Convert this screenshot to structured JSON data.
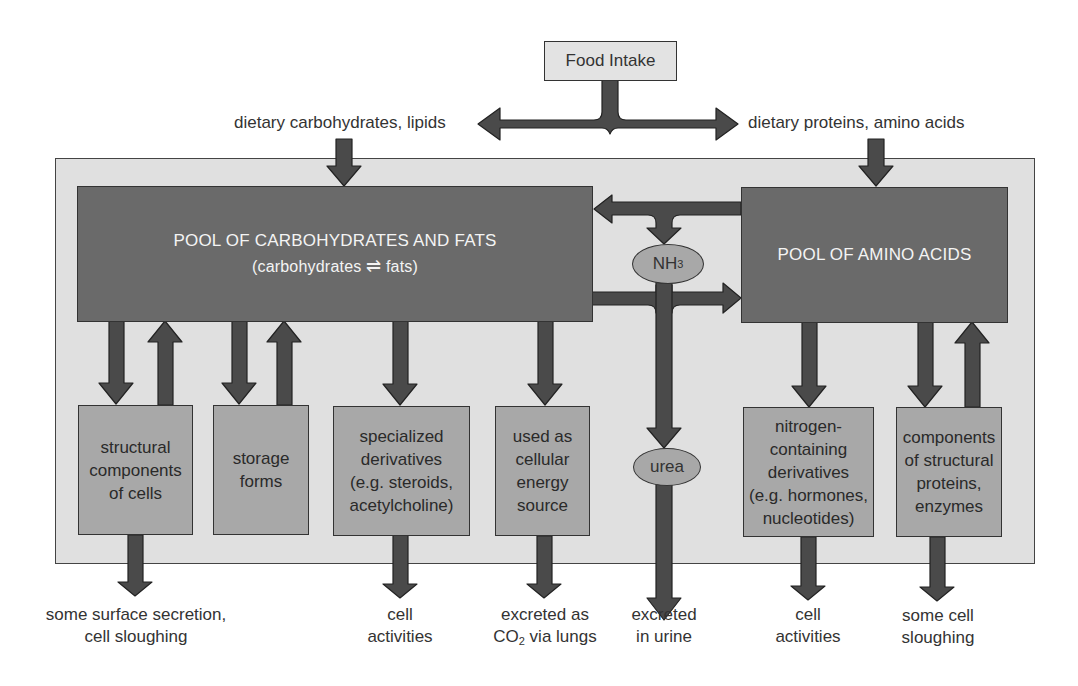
{
  "top": {
    "food_intake": "Food Intake",
    "left_input": "dietary carbohydrates, lipids",
    "right_input": "dietary proteins, amino acids"
  },
  "pools": {
    "carb_fat": {
      "title": "POOL OF CARBOHYDRATES AND FATS",
      "subtitle_left": "(carbohydrates",
      "subtitle_right": "fats)",
      "equilibrium_symbol": "⇌"
    },
    "amino": {
      "title": "POOL OF AMINO ACIDS"
    }
  },
  "intermediates": {
    "nh3": {
      "base": "NH",
      "subscript": "3"
    },
    "urea": "urea"
  },
  "boxes": [
    {
      "id": "structural",
      "lines": [
        "structural",
        "components",
        "of cells"
      ]
    },
    {
      "id": "storage",
      "lines": [
        "storage",
        "forms"
      ]
    },
    {
      "id": "specialized",
      "lines": [
        "specialized",
        "derivatives",
        "(e.g. steroids,",
        "acetylcholine)"
      ]
    },
    {
      "id": "energy",
      "lines": [
        "used as",
        "cellular",
        "energy",
        "source"
      ]
    },
    {
      "id": "nitrogen",
      "lines": [
        "nitrogen-",
        "containing",
        "derivatives",
        "(e.g. hormones,",
        "nucleotides)"
      ]
    },
    {
      "id": "proteins",
      "lines": [
        "components",
        "of structural",
        "proteins,",
        "enzymes"
      ]
    }
  ],
  "outputs": [
    {
      "id": "secretion",
      "lines": [
        "some surface secretion,",
        "cell sloughing"
      ]
    },
    {
      "id": "cell_act_1",
      "lines": [
        "cell",
        "activities"
      ]
    },
    {
      "id": "co2",
      "line1": "excreted as",
      "line2_pre": "CO",
      "line2_sub": "2",
      "line2_post": " via lungs"
    },
    {
      "id": "urine",
      "lines": [
        "excreted",
        "in urine"
      ]
    },
    {
      "id": "cell_act_2",
      "lines": [
        "cell",
        "activities"
      ]
    },
    {
      "id": "sloughing",
      "lines": [
        "some cell",
        "sloughing"
      ]
    }
  ],
  "colors": {
    "arrow": "#4a4a4a",
    "pool": "#6a6a6a",
    "box": "#a8a8a8",
    "outer": "#e0e0e0",
    "food": "#e3e3e3"
  }
}
